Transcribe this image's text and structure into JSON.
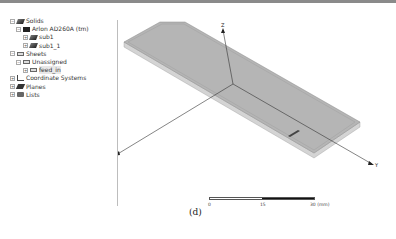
{
  "tree": {
    "items": [
      {
        "label": "Solids",
        "level": 0,
        "expander": "−",
        "icon": "solid-icon"
      },
      {
        "label": "Arlon AD260A (tm)",
        "level": 1,
        "expander": "−",
        "icon": "material-icon"
      },
      {
        "label": "sub1",
        "level": 2,
        "expander": "+",
        "icon": "solid-icon"
      },
      {
        "label": "sub1_1",
        "level": 2,
        "expander": "+",
        "icon": "solid-icon"
      },
      {
        "label": "Sheets",
        "level": 0,
        "expander": "−",
        "icon": "sheet-icon"
      },
      {
        "label": "Unassigned",
        "level": 1,
        "expander": "−",
        "icon": "sheet-icon"
      },
      {
        "label": "feed_in",
        "level": 2,
        "expander": "+",
        "icon": "sheet-icon"
      },
      {
        "label": "Coordinate Systems",
        "level": 0,
        "expander": "+",
        "icon": "coordinate-icon"
      },
      {
        "label": "Planes",
        "level": 0,
        "expander": "+",
        "icon": "planes-icon"
      },
      {
        "label": "Lists",
        "level": 0,
        "expander": "+",
        "icon": "lists-icon"
      }
    ]
  },
  "viewport": {
    "axes": {
      "z": "Z",
      "y": "Y",
      "x": "X"
    },
    "scale_bar": {
      "labels": [
        "0",
        "15",
        "30 (mm)"
      ]
    }
  },
  "caption": "(d)",
  "colors": {
    "board_top": "#b3b3b3",
    "board_edge": "#d4d4d4",
    "axis": "#333333"
  }
}
